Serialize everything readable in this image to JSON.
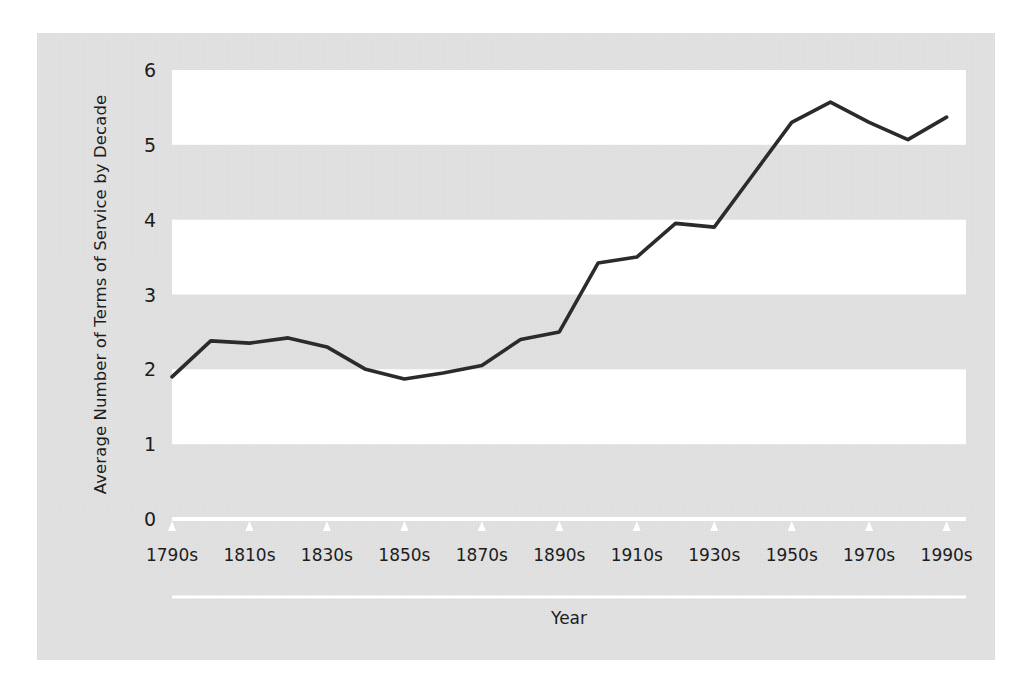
{
  "chart_data": {
    "type": "line",
    "title": "",
    "xlabel": "Year",
    "ylabel": "Average Number of Terms of Service by Decade",
    "xlim": [
      1790,
      1995
    ],
    "ylim": [
      0,
      6
    ],
    "yticks": [
      0,
      1,
      2,
      3,
      4,
      5,
      6
    ],
    "ytick_labels": [
      "0",
      "1",
      "2",
      "3",
      "4",
      "5",
      "6"
    ],
    "xtick_labels": [
      "1790s",
      "1810s",
      "1830s",
      "1850s",
      "1870s",
      "1890s",
      "1910s",
      "1930s",
      "1950s",
      "1970s",
      "1990s"
    ],
    "xtick_values": [
      1790,
      1810,
      1830,
      1850,
      1870,
      1890,
      1910,
      1930,
      1950,
      1970,
      1990
    ],
    "categories": [
      "1790s",
      "1800s",
      "1810s",
      "1820s",
      "1830s",
      "1840s",
      "1850s",
      "1860s",
      "1870s",
      "1880s",
      "1890s",
      "1900s",
      "1910s",
      "1920s",
      "1930s",
      "1940s",
      "1950s",
      "1960s",
      "1970s",
      "1980s",
      "1990s"
    ],
    "x": [
      1790,
      1800,
      1810,
      1820,
      1830,
      1840,
      1850,
      1860,
      1870,
      1880,
      1890,
      1900,
      1910,
      1920,
      1930,
      1940,
      1950,
      1960,
      1970,
      1980,
      1990
    ],
    "values": [
      1.9,
      2.38,
      2.35,
      2.42,
      2.3,
      2.0,
      1.87,
      1.95,
      2.05,
      2.4,
      2.5,
      3.42,
      3.5,
      3.95,
      3.9,
      4.6,
      5.3,
      5.57,
      5.3,
      5.07,
      5.37
    ],
    "series": [
      {
        "name": "Average Number of Terms of Service by Decade",
        "values": [
          1.9,
          2.38,
          2.35,
          2.42,
          2.3,
          2.0,
          1.87,
          1.95,
          2.05,
          2.4,
          2.5,
          3.42,
          3.5,
          3.95,
          3.9,
          4.6,
          5.3,
          5.57,
          5.3,
          5.07,
          5.37
        ]
      }
    ],
    "grid": "alternating-horizontal-bands",
    "band_ranges": [
      [
        1,
        2
      ],
      [
        3,
        4
      ],
      [
        5,
        6
      ]
    ],
    "legend": "none",
    "colors": {
      "line": "#2b2b2b",
      "panel_background": "#e2e2e2",
      "band_background": "#ffffff",
      "axis_rule": "#ffffff",
      "text": "#1d1d1d"
    }
  }
}
